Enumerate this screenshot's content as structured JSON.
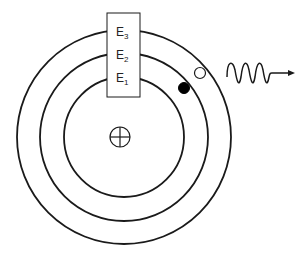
{
  "diagram": {
    "nucleus": {
      "symbol": "plus-in-circle",
      "label": "nucleus"
    },
    "orbits": [
      {
        "name": "E1",
        "radius": 60
      },
      {
        "name": "E2",
        "radius": 84
      },
      {
        "name": "E3",
        "radius": 107
      }
    ],
    "energy_levels": [
      {
        "letter": "E",
        "sub": "3"
      },
      {
        "letter": "E",
        "sub": "2"
      },
      {
        "letter": "E",
        "sub": "1"
      }
    ],
    "electron_filled": {
      "orbit": "E2",
      "fill": "#000000"
    },
    "electron_empty": {
      "orbit": "E3",
      "fill": "#ffffff"
    },
    "photon": {
      "shape": "wavy-arrow",
      "direction": "right"
    },
    "colors": {
      "stroke": "#1a1a1a",
      "background": "#ffffff"
    }
  }
}
